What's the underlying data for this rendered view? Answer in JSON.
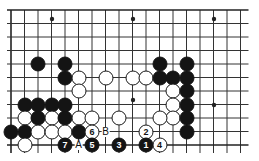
{
  "diagram": {
    "type": "go-board-diagram",
    "title": "",
    "board": {
      "cols": 18,
      "rows": 11,
      "origin_x": 11,
      "origin_y": 10,
      "spacing": 13.5,
      "line_color": "#333333",
      "edge_color": "#222222",
      "background": "#ffffff"
    },
    "star_points": [
      {
        "cx": 52,
        "cy": 19
      },
      {
        "cx": 133,
        "cy": 19
      },
      {
        "cx": 214,
        "cy": 19
      },
      {
        "cx": 133,
        "cy": 100
      },
      {
        "cx": 214,
        "cy": 105
      }
    ],
    "stones": [
      {
        "color": "black",
        "cx": 38,
        "cy": 64,
        "label": ""
      },
      {
        "color": "black",
        "cx": 65,
        "cy": 64,
        "label": ""
      },
      {
        "color": "black",
        "cx": 65,
        "cy": 77.5,
        "label": ""
      },
      {
        "color": "white",
        "cx": 78.5,
        "cy": 77.5,
        "label": ""
      },
      {
        "color": "white",
        "cx": 78.5,
        "cy": 91,
        "label": ""
      },
      {
        "color": "white",
        "cx": 105.5,
        "cy": 77.5,
        "label": ""
      },
      {
        "color": "white",
        "cx": 132.5,
        "cy": 77.5,
        "label": ""
      },
      {
        "color": "white",
        "cx": 146,
        "cy": 77.5,
        "label": ""
      },
      {
        "color": "black",
        "cx": 159.5,
        "cy": 64,
        "label": ""
      },
      {
        "color": "black",
        "cx": 186.5,
        "cy": 64,
        "label": ""
      },
      {
        "color": "black",
        "cx": 159.5,
        "cy": 77.5,
        "label": ""
      },
      {
        "color": "black",
        "cx": 173,
        "cy": 77.5,
        "label": ""
      },
      {
        "color": "black",
        "cx": 186.5,
        "cy": 77.5,
        "label": ""
      },
      {
        "color": "white",
        "cx": 173,
        "cy": 91,
        "label": ""
      },
      {
        "color": "black",
        "cx": 186.5,
        "cy": 91,
        "label": ""
      },
      {
        "color": "white",
        "cx": 173,
        "cy": 104.5,
        "label": ""
      },
      {
        "color": "black",
        "cx": 186.5,
        "cy": 104.5,
        "label": ""
      },
      {
        "color": "black",
        "cx": 24.5,
        "cy": 104.5,
        "label": ""
      },
      {
        "color": "black",
        "cx": 38,
        "cy": 104.5,
        "label": ""
      },
      {
        "color": "black",
        "cx": 51.5,
        "cy": 104.5,
        "label": ""
      },
      {
        "color": "black",
        "cx": 65,
        "cy": 104.5,
        "label": ""
      },
      {
        "color": "white",
        "cx": 24.5,
        "cy": 118,
        "label": ""
      },
      {
        "color": "black",
        "cx": 38,
        "cy": 118,
        "label": ""
      },
      {
        "color": "white",
        "cx": 51.5,
        "cy": 118,
        "label": ""
      },
      {
        "color": "black",
        "cx": 65,
        "cy": 118,
        "label": ""
      },
      {
        "color": "white",
        "cx": 78.5,
        "cy": 118,
        "label": ""
      },
      {
        "color": "white",
        "cx": 92,
        "cy": 118,
        "label": ""
      },
      {
        "color": "white",
        "cx": 119,
        "cy": 118,
        "label": ""
      },
      {
        "color": "white",
        "cx": 173,
        "cy": 118,
        "label": ""
      },
      {
        "color": "white",
        "cx": 159.5,
        "cy": 118,
        "label": ""
      },
      {
        "color": "black",
        "cx": 186.5,
        "cy": 118,
        "label": ""
      },
      {
        "color": "black",
        "cx": 11,
        "cy": 131.5,
        "label": ""
      },
      {
        "color": "black",
        "cx": 24.5,
        "cy": 131.5,
        "label": ""
      },
      {
        "color": "white",
        "cx": 38,
        "cy": 131.5,
        "label": ""
      },
      {
        "color": "white",
        "cx": 51.5,
        "cy": 131.5,
        "label": ""
      },
      {
        "color": "white",
        "cx": 65,
        "cy": 131.5,
        "label": ""
      },
      {
        "color": "black",
        "cx": 78.5,
        "cy": 131.5,
        "label": ""
      },
      {
        "color": "black",
        "cx": 186.5,
        "cy": 131.5,
        "label": ""
      },
      {
        "color": "white",
        "cx": 24.5,
        "cy": 145,
        "label": ""
      },
      {
        "color": "white",
        "cx": 92,
        "cy": 131.5,
        "label": "6"
      },
      {
        "color": "white",
        "cx": 146,
        "cy": 131.5,
        "label": "2"
      },
      {
        "color": "black",
        "cx": 65,
        "cy": 145,
        "label": "7"
      },
      {
        "color": "black",
        "cx": 92,
        "cy": 145,
        "label": "5"
      },
      {
        "color": "black",
        "cx": 119,
        "cy": 145,
        "label": "3"
      },
      {
        "color": "black",
        "cx": 146,
        "cy": 145,
        "label": "1"
      },
      {
        "color": "white",
        "cx": 159.5,
        "cy": 145,
        "label": "4"
      }
    ],
    "point_markers": [
      {
        "text": "A",
        "cx": 78.5,
        "cy": 145
      },
      {
        "text": "B",
        "cx": 105.5,
        "cy": 131.5
      }
    ]
  }
}
